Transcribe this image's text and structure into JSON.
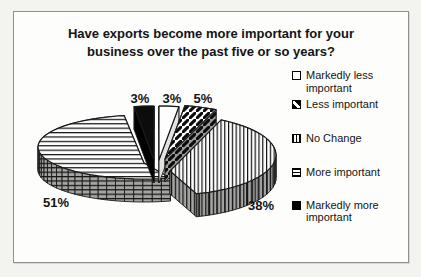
{
  "chart_title_lines": [
    "Have exports become more important for your",
    "business over the past five or so years?"
  ],
  "chart_data": {
    "type": "pie",
    "style": "3d-exploded-monochrome-hatched",
    "title": "Have exports become more important for your business over the past five or so years?",
    "categories": [
      "Markedly less important",
      "Less important",
      "No Change",
      "More important",
      "Markedly more important"
    ],
    "values": [
      3,
      5,
      38,
      51,
      3
    ],
    "unit": "%",
    "start_angle_deg": 0,
    "direction": "clockwise",
    "legend_position": "right",
    "slices": [
      {
        "label": "Markedly less important",
        "value": 3,
        "data_label": "3%",
        "pattern": "solid-white"
      },
      {
        "label": "Less important",
        "value": 5,
        "data_label": "5%",
        "pattern": "diagonal-stripes"
      },
      {
        "label": "No Change",
        "value": 38,
        "data_label": "38%",
        "pattern": "vertical-lines"
      },
      {
        "label": "More important",
        "value": 51,
        "data_label": "51%",
        "pattern": "horizontal-lines"
      },
      {
        "label": "Markedly more important",
        "value": 3,
        "data_label": "3%",
        "pattern": "solid-black"
      }
    ],
    "colors": {
      "ink": "#141414",
      "page_background": "#f3f3f0",
      "chart_background": "#fdfdfc",
      "chart_border": "#8f8f8f",
      "side_shade_gray": "#a4a4a2"
    }
  }
}
